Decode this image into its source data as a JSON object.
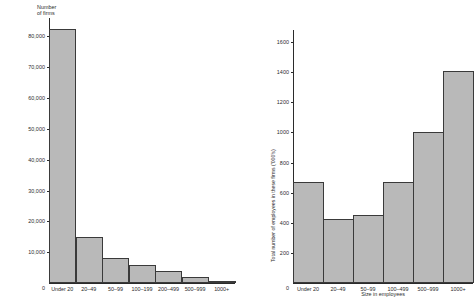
{
  "figure": {
    "background": "#ffffff",
    "bar_fill": "#b9b9b9",
    "bar_stroke": "#3a3a3a",
    "axis_color": "#2b2b2b"
  },
  "chart_data": [
    {
      "type": "bar",
      "id": "number-of-firms",
      "title": "",
      "ylabel": "Number\nof firms",
      "xlabel": "",
      "categories": [
        "Under 20",
        "20–49",
        "50–99",
        "100–199",
        "200–499",
        "500–999",
        "1000+"
      ],
      "values": [
        82500,
        15000,
        8000,
        6000,
        4000,
        2000,
        700
      ],
      "ylim": [
        0,
        86000
      ],
      "yticks": [
        0,
        10000,
        20000,
        30000,
        40000,
        50000,
        60000,
        70000,
        80000
      ],
      "ytick_labels": [
        "0",
        "10,000",
        "20,000",
        "30,000",
        "40,000",
        "50,000",
        "60,000",
        "70,000",
        "80,000"
      ],
      "grid": false,
      "legend": "none"
    },
    {
      "type": "bar",
      "id": "total-employees",
      "title": "",
      "ylabel": "Total number of employees in these firms ('000's)",
      "xlabel": "Size in employees",
      "categories": [
        "Under 20",
        "20–49",
        "50–99",
        "100–499",
        "500–999",
        "1000+"
      ],
      "values": [
        670,
        425,
        450,
        670,
        1000,
        1405
      ],
      "ylim": [
        0,
        1680
      ],
      "yticks": [
        0,
        200,
        400,
        600,
        800,
        1000,
        1200,
        1400,
        1600
      ],
      "ytick_labels": [
        "0",
        "200",
        "400",
        "600",
        "800",
        "1000",
        "1200",
        "1400",
        "1600"
      ],
      "grid": false,
      "legend": "none"
    }
  ]
}
